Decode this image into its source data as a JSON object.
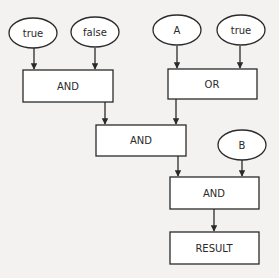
{
  "diagram": {
    "type": "boolean-logic-flowchart",
    "nodes": [
      {
        "id": "in_true1",
        "shape": "ellipse",
        "label": "true"
      },
      {
        "id": "in_false",
        "shape": "ellipse",
        "label": "false"
      },
      {
        "id": "in_A",
        "shape": "ellipse",
        "label": "A"
      },
      {
        "id": "in_true2",
        "shape": "ellipse",
        "label": "true"
      },
      {
        "id": "and1",
        "shape": "rect",
        "label": "AND"
      },
      {
        "id": "or1",
        "shape": "rect",
        "label": "OR"
      },
      {
        "id": "and2",
        "shape": "rect",
        "label": "AND"
      },
      {
        "id": "in_B",
        "shape": "ellipse",
        "label": "B"
      },
      {
        "id": "and3",
        "shape": "rect",
        "label": "AND"
      },
      {
        "id": "result",
        "shape": "rect",
        "label": "RESULT"
      }
    ],
    "edges": [
      {
        "from": "in_true1",
        "to": "and1"
      },
      {
        "from": "in_false",
        "to": "and1"
      },
      {
        "from": "in_A",
        "to": "or1"
      },
      {
        "from": "in_true2",
        "to": "or1"
      },
      {
        "from": "and1",
        "to": "and2"
      },
      {
        "from": "or1",
        "to": "and2"
      },
      {
        "from": "and2",
        "to": "and3"
      },
      {
        "from": "in_B",
        "to": "and3"
      },
      {
        "from": "and3",
        "to": "result"
      }
    ]
  }
}
